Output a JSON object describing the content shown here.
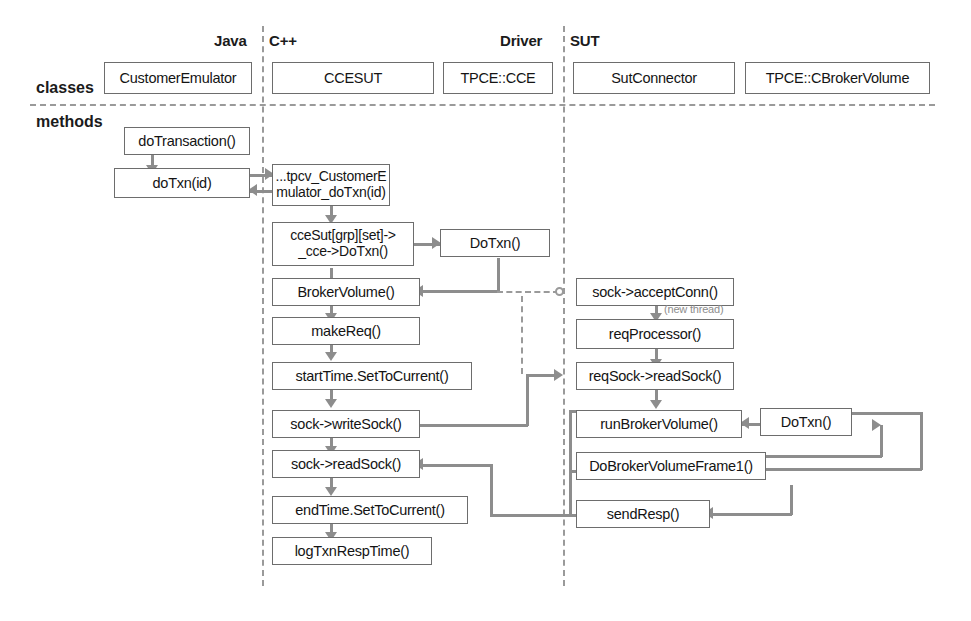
{
  "diagram": {
    "row_labels": {
      "classes": "classes",
      "methods": "methods"
    },
    "lanes": [
      {
        "id": "java",
        "label": "Java"
      },
      {
        "id": "cpp",
        "label": "C++"
      },
      {
        "id": "driver",
        "label": "Driver"
      },
      {
        "id": "sut",
        "label": "SUT"
      }
    ],
    "classes": [
      {
        "id": "customer-emulator",
        "label": "CustomerEmulator"
      },
      {
        "id": "ccesut",
        "label": "CCESUT"
      },
      {
        "id": "tpce-cce",
        "label": "TPCE::CCE"
      },
      {
        "id": "sut-connector",
        "label": "SutConnector"
      },
      {
        "id": "tpce-cbrokervolume",
        "label": "TPCE::CBrokerVolume"
      }
    ],
    "methods": {
      "java": [
        {
          "id": "do-transaction",
          "label": "doTransaction()"
        },
        {
          "id": "do-txn-id",
          "label": "doTxn(id)"
        }
      ],
      "cpp": [
        {
          "id": "tpcv-customer-emulator-dotxn",
          "label": "...tpcv_CustomerE\nmulator_doTxn(id)"
        },
        {
          "id": "ccesut-grp-set-cce-dotxn",
          "label": "cceSut[grp][set]->\n_cce->DoTxn()"
        },
        {
          "id": "broker-volume",
          "label": "BrokerVolume()"
        },
        {
          "id": "make-req",
          "label": "makeReq()"
        },
        {
          "id": "start-time-set-to-current",
          "label": "startTime.SetToCurrent()"
        },
        {
          "id": "sock-write-sock",
          "label": "sock->writeSock()"
        },
        {
          "id": "sock-read-sock",
          "label": "sock->readSock()"
        },
        {
          "id": "end-time-set-to-current",
          "label": "endTime.SetToCurrent()"
        },
        {
          "id": "log-txn-resp-time",
          "label": "logTxnRespTime()"
        }
      ],
      "driver": [
        {
          "id": "driver-dotxn",
          "label": "DoTxn()"
        }
      ],
      "sut": [
        {
          "id": "sock-accept-conn",
          "label": "sock->acceptConn()"
        },
        {
          "id": "req-processor",
          "label": "reqProcessor()"
        },
        {
          "id": "req-sock-read-sock",
          "label": "reqSock->readSock()"
        },
        {
          "id": "run-broker-volume",
          "label": "runBrokerVolume()"
        },
        {
          "id": "do-broker-volume-frame1",
          "label": "DoBrokerVolumeFrame1()"
        },
        {
          "id": "send-resp",
          "label": "sendResp()"
        }
      ],
      "broker": [
        {
          "id": "broker-dotxn",
          "label": "DoTxn()"
        }
      ]
    },
    "annotations": [
      {
        "id": "new-thread-note",
        "label": "(new thread)"
      }
    ],
    "colors": {
      "box_border": "#6d6d6d",
      "connector": "#8d8d8d",
      "divider": "#9a9a9a",
      "text": "#141414",
      "background": "#ffffff"
    }
  }
}
